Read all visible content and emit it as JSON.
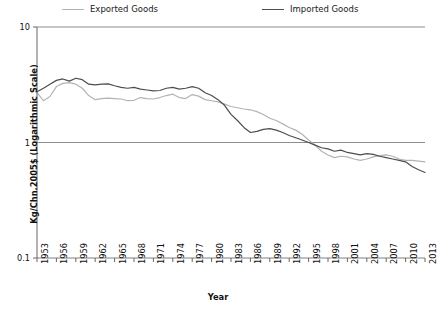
{
  "legend": {
    "position": "top",
    "entries": [
      {
        "label": "Exported Goods",
        "color": "#b3b3b3"
      },
      {
        "label": "Imported Goods",
        "color": "#4d4d4d"
      }
    ]
  },
  "axes": {
    "ylabel": "Kg/Chn.2005$ (Logarithmic Scale)",
    "xlabel": "Year",
    "yticks": [
      "10",
      "1",
      "0.1"
    ],
    "xticks": [
      "1953",
      "1956",
      "1959",
      "1962",
      "1965",
      "1968",
      "1971",
      "1974",
      "1977",
      "1980",
      "1983",
      "1986",
      "1989",
      "1992",
      "1995",
      "1998",
      "2001",
      "2004",
      "2007",
      "2010",
      "2013"
    ]
  },
  "chart_data": {
    "type": "line",
    "title": "",
    "xlabel": "Year",
    "ylabel": "Kg/Chn.2005$ (Logarithmic Scale)",
    "yscale": "log",
    "ylim": [
      0.1,
      10
    ],
    "xlim": [
      1953,
      2013
    ],
    "grid": true,
    "legend_position": "top",
    "x": [
      1953,
      1954,
      1955,
      1956,
      1957,
      1958,
      1959,
      1960,
      1961,
      1962,
      1963,
      1964,
      1965,
      1966,
      1967,
      1968,
      1969,
      1970,
      1971,
      1972,
      1973,
      1974,
      1975,
      1976,
      1977,
      1978,
      1979,
      1980,
      1981,
      1982,
      1983,
      1984,
      1985,
      1986,
      1987,
      1988,
      1989,
      1990,
      1991,
      1992,
      1993,
      1994,
      1995,
      1996,
      1997,
      1998,
      1999,
      2000,
      2001,
      2002,
      2003,
      2004,
      2005,
      2006,
      2007,
      2008,
      2009,
      2010,
      2011,
      2012,
      2013
    ],
    "series": [
      {
        "name": "Exported Goods",
        "color": "#b3b3b3",
        "values": [
          2.7,
          2.3,
          2.5,
          3.05,
          3.25,
          3.3,
          3.2,
          2.95,
          2.55,
          2.35,
          2.4,
          2.42,
          2.4,
          2.38,
          2.3,
          2.32,
          2.45,
          2.4,
          2.38,
          2.45,
          2.55,
          2.62,
          2.45,
          2.4,
          2.6,
          2.52,
          2.35,
          2.3,
          2.25,
          2.15,
          2.05,
          2.0,
          1.95,
          1.92,
          1.85,
          1.75,
          1.62,
          1.55,
          1.45,
          1.35,
          1.28,
          1.18,
          1.05,
          0.95,
          0.84,
          0.78,
          0.74,
          0.76,
          0.75,
          0.72,
          0.7,
          0.72,
          0.75,
          0.77,
          0.78,
          0.76,
          0.72,
          0.7,
          0.7,
          0.69,
          0.68
        ]
      },
      {
        "name": "Imported Goods",
        "color": "#4d4d4d",
        "values": [
          2.75,
          2.95,
          3.2,
          3.45,
          3.55,
          3.4,
          3.6,
          3.5,
          3.2,
          3.15,
          3.2,
          3.22,
          3.1,
          3.0,
          2.95,
          3.0,
          2.9,
          2.85,
          2.8,
          2.82,
          2.95,
          3.0,
          2.9,
          2.95,
          3.05,
          2.95,
          2.7,
          2.55,
          2.35,
          2.1,
          1.75,
          1.55,
          1.35,
          1.22,
          1.25,
          1.3,
          1.32,
          1.28,
          1.22,
          1.15,
          1.1,
          1.05,
          1.0,
          0.95,
          0.9,
          0.88,
          0.84,
          0.86,
          0.82,
          0.8,
          0.78,
          0.8,
          0.79,
          0.76,
          0.74,
          0.72,
          0.7,
          0.68,
          0.62,
          0.58,
          0.55
        ]
      }
    ]
  }
}
